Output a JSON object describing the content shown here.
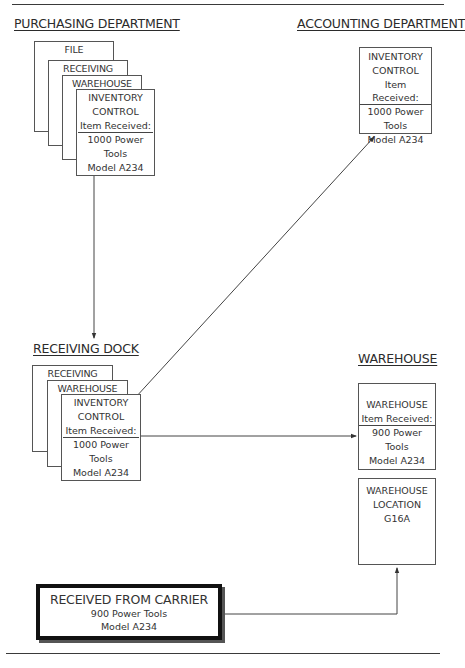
{
  "diagram": {
    "type": "flow-diagram",
    "sections": {
      "purchasing": {
        "title": "PURCHASING DEPARTMENT",
        "copies": [
          "FILE",
          "RECEIVING",
          "WAREHOUSE"
        ],
        "form": {
          "line1": "INVENTORY",
          "line2": "CONTROL",
          "label": "Item Received:",
          "qty": "1000 Power",
          "item": "Tools",
          "model": "Model A234"
        }
      },
      "accounting": {
        "title": "ACCOUNTING DEPARTMENT",
        "form": {
          "line1": "INVENTORY",
          "line2": "CONTROL",
          "label": "Item Received:",
          "qty": "1000 Power",
          "item": "Tools",
          "model": "Model A234"
        }
      },
      "receiving_dock": {
        "title": "RECEIVING DOCK",
        "copies": [
          "RECEIVING",
          "WAREHOUSE"
        ],
        "form": {
          "line1": "INVENTORY",
          "line2": "CONTROL",
          "label": "Item Received:",
          "qty": "1000 Power",
          "item": "Tools",
          "model": "Model A234"
        }
      },
      "warehouse": {
        "title": "WAREHOUSE",
        "form": {
          "line1": "WAREHOUSE",
          "label": "Item Received:",
          "qty": "900 Power",
          "item": "Tools",
          "model": "Model A234"
        },
        "location": {
          "line1": "WAREHOUSE",
          "line2": "LOCATION",
          "code": "G16A"
        }
      },
      "carrier": {
        "title": "RECEIVED FROM CARRIER",
        "qty": "900 Power Tools",
        "model": "Model A234"
      }
    },
    "edges": [
      {
        "from": "purchasing.form",
        "to": "receiving_dock",
        "style": "arrow"
      },
      {
        "from": "receiving_dock.form",
        "to": "accounting.form",
        "style": "arrow"
      },
      {
        "from": "receiving_dock.form",
        "to": "warehouse.form",
        "style": "arrow"
      },
      {
        "from": "carrier",
        "to": "warehouse.location",
        "style": "arrow"
      }
    ]
  }
}
